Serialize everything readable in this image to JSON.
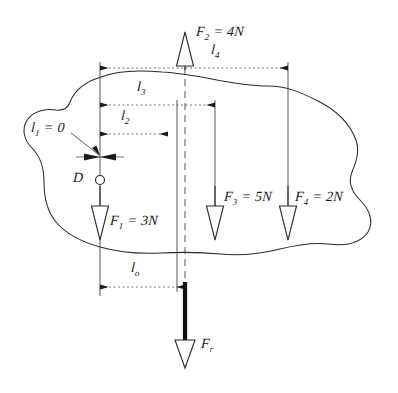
{
  "figure": {
    "type": "engineering-line-drawing",
    "background": "#ffffff",
    "ink_color": "#1a1a1a",
    "width": 398,
    "height": 393
  },
  "pivot": {
    "label": "D",
    "name": "pivot-point-d",
    "x": 100,
    "y": 180,
    "radius": 4.5
  },
  "forces": [
    {
      "id": "F1",
      "label": "F₁ = 3N",
      "label_base": "F",
      "label_sub": "1",
      "label_value": "= 3N",
      "magnitude": 3,
      "unit": "N",
      "direction": "down",
      "x": 100,
      "label_x": 110,
      "label_y": 222,
      "arrow_tip_y": 240,
      "arrow_top_y": 205
    },
    {
      "id": "F2",
      "label": "F₂ = 4N",
      "label_base": "F",
      "label_sub": "2",
      "label_value": "= 4N",
      "magnitude": 4,
      "unit": "N",
      "direction": "up",
      "x": 185,
      "label_x": 196,
      "label_y": 30,
      "arrow_tip_y": 32,
      "arrow_top_y": 67
    },
    {
      "id": "F3",
      "label": "F₃ = 5N",
      "label_base": "F",
      "label_sub": "3",
      "label_value": "= 5N",
      "magnitude": 5,
      "unit": "N",
      "direction": "down",
      "x": 215,
      "label_x": 224,
      "label_y": 198,
      "arrow_tip_y": 240,
      "arrow_top_y": 205
    },
    {
      "id": "F4",
      "label": "F₄ = 2N",
      "label_base": "F",
      "label_sub": "4",
      "label_value": "= 2N",
      "magnitude": 2,
      "unit": "N",
      "direction": "down",
      "x": 288,
      "label_x": 296,
      "label_y": 198,
      "arrow_tip_y": 240,
      "arrow_top_y": 205
    },
    {
      "id": "Fr",
      "label": "Fr",
      "label_base": "F",
      "label_sub": "r",
      "label_value": "",
      "magnitude": null,
      "unit": "",
      "direction": "down",
      "x": 185,
      "label_x": 201,
      "label_y": 344,
      "arrow_tip_y": 368,
      "arrow_top_y": 282,
      "style": "resultant-thick"
    }
  ],
  "dimensions": [
    {
      "id": "l4",
      "label_base": "l",
      "label_sub": "4",
      "label_value": "",
      "label": "l₄",
      "x1": 100,
      "x2": 288,
      "y": 68,
      "label_x": 216,
      "label_y": 48,
      "from_force": "D",
      "to_force": "F4"
    },
    {
      "id": "l3",
      "label_base": "l",
      "label_sub": "3",
      "label_value": "",
      "label": "l₃",
      "x1": 100,
      "x2": 215,
      "y": 105,
      "label_x": 140,
      "label_y": 84,
      "from_force": "D",
      "to_force": "F3"
    },
    {
      "id": "l2",
      "label_base": "l",
      "label_sub": "2",
      "label_value": "",
      "label": "l₂",
      "x1": 100,
      "x2": 168,
      "y": 134,
      "label_x": 124,
      "label_y": 113,
      "from_force": "D",
      "to_force": "F2"
    },
    {
      "id": "l1",
      "label_base": "l",
      "label_sub": "1",
      "label_value": "= 0",
      "label": "l₁ = 0",
      "x1": 100,
      "x2": 100,
      "y": 157,
      "label_x": 33,
      "label_y": 124,
      "from_force": "D",
      "to_force": "F1",
      "zero_length": true
    },
    {
      "id": "l0",
      "label_base": "l",
      "label_sub": "o",
      "label_value": "",
      "label": "l₀",
      "x1": 100,
      "x2": 185,
      "y": 287,
      "label_x": 134,
      "label_y": 265,
      "from_force": "D",
      "to_force": "Fr"
    }
  ],
  "centerline": {
    "name": "resultant-centerline",
    "x": 185,
    "y1": 55,
    "y2": 290,
    "style": "dashed"
  },
  "body_outline": {
    "name": "rigid-body-outline",
    "description": "irregular closed freehand blob representing the rigid body",
    "path": "M 101,77 C 118,70 140,70 162,72 C 180,73 196,76 212,79 C 232,83 250,86 268,86 C 286,86 300,92 318,101 C 336,110 350,124 356,140 C 360,152 356,162 352,172 C 348,182 352,192 360,200 C 370,210 374,222 368,232 C 360,244 344,246 328,244 C 312,242 296,245 280,249 C 260,254 240,256 220,254 C 200,252 180,252 160,253 C 140,254 118,252 100,247 C 82,242 66,234 56,222 C 46,210 44,196 44,182 C 44,168 40,156 32,148 C 24,140 22,130 26,122 C 31,112 44,108 56,110 C 64,111 68,108 70,102 C 74,92 84,82 101,77 Z"
  },
  "extension_lines": [
    {
      "name": "ext-line-d",
      "x": 100,
      "y1": 62,
      "y2": 295
    },
    {
      "name": "ext-line-f2",
      "x": 177,
      "y1": 100,
      "y2": 292
    },
    {
      "name": "ext-line-f3",
      "x": 215,
      "y1": 100,
      "y2": 205
    },
    {
      "name": "ext-line-f4",
      "x": 288,
      "y1": 62,
      "y2": 205
    }
  ]
}
